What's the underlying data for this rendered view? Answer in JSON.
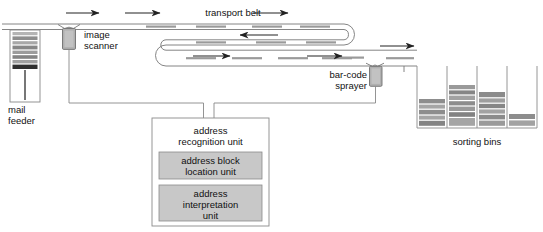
{
  "diagram": {
    "background_color": "#ffffff",
    "line_color": "#555555",
    "arrow_color": "#222222",
    "fill_gray": "#9a9a9a",
    "fill_light_gray": "#c8c8c8",
    "fill_dark": "#3a3a3a"
  },
  "labels": {
    "transport_belt": "transport belt",
    "image_scanner": "image\nscanner",
    "mail_feeder": "mail\nfeeder",
    "barcode_sprayer": "bar-code\nsprayer",
    "sorting_bins": "sorting bins",
    "address_recognition_unit": "address\nrecognition unit",
    "address_block_location_unit": "address block\nlocation unit",
    "address_interpretation_unit": "address\ninterpretation\nunit"
  },
  "components": {
    "mail_feeder": {
      "name": "mail-feeder",
      "x": 10,
      "y": 30,
      "width": 30,
      "height": 72,
      "stack_items": 8
    },
    "image_scanner": {
      "name": "image-scanner",
      "x": 62,
      "y": 28,
      "width": 14,
      "height": 22
    },
    "barcode_sprayer": {
      "name": "barcode-sprayer",
      "x": 370,
      "y": 62,
      "width": 14,
      "height": 22
    },
    "address_recognition_unit": {
      "name": "address-recognition-unit",
      "x": 152,
      "y": 118,
      "width": 117,
      "height": 108
    },
    "sorting_bins": {
      "name": "sorting-bins",
      "count": 4,
      "bin_stack_counts": [
        5,
        7,
        6,
        2
      ],
      "x": 417,
      "y": 66,
      "width": 120,
      "height": 62
    }
  },
  "flow_arrows": [
    {
      "name": "feed-arrow",
      "direction": "right"
    },
    {
      "name": "belt-arrow-top-mid",
      "direction": "right"
    },
    {
      "name": "belt-arrow-top-right",
      "direction": "right"
    },
    {
      "name": "belt-arrow-return",
      "direction": "left"
    },
    {
      "name": "belt-arrow-lower",
      "direction": "right"
    },
    {
      "name": "belt-arrow-exit",
      "direction": "right"
    }
  ]
}
